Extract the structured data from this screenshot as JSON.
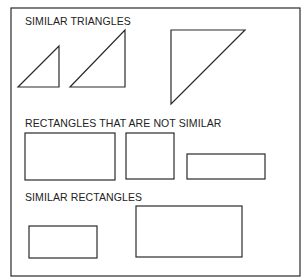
{
  "sections": [
    {
      "title": "SIMILAR TRIANGLES"
    },
    {
      "title": "RECTANGLES THAT ARE NOT SIMILAR"
    },
    {
      "title": "SIMILAR RECTANGLES"
    }
  ],
  "colors": {
    "stroke": "#2a2a2a",
    "background": "#ffffff"
  },
  "shapes": {
    "frame": {
      "x": 11,
      "y": 8,
      "w": 289,
      "h": 268
    },
    "triangles": [
      {
        "points": "18,87 59,87 59,46"
      },
      {
        "points": "70,87 125,87 125,30"
      },
      {
        "points": "171,30 245,30 171,104"
      }
    ],
    "not_similar_rects": [
      {
        "x": 25,
        "y": 133,
        "w": 90,
        "h": 47
      },
      {
        "x": 126,
        "y": 133,
        "w": 48,
        "h": 46
      },
      {
        "x": 187,
        "y": 154,
        "w": 78,
        "h": 25
      }
    ],
    "similar_rects": [
      {
        "x": 29,
        "y": 226,
        "w": 68,
        "h": 32
      },
      {
        "x": 136,
        "y": 206,
        "w": 106,
        "h": 51
      }
    ]
  }
}
